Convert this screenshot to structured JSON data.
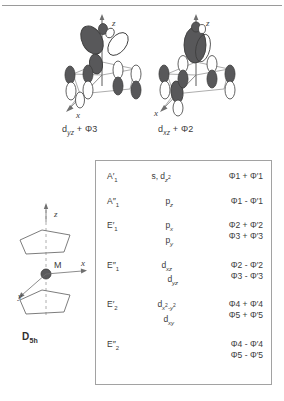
{
  "figure": {
    "title_line": "divider-rule",
    "orbital_diagrams": [
      {
        "id": "dyz-phi3",
        "caption_main": "d",
        "caption_sub": "yz",
        "caption_rest": " + Φ3",
        "axis_z": "z",
        "axis_x": "x"
      },
      {
        "id": "dxz-phi2",
        "caption_main": "d",
        "caption_sub": "xz",
        "caption_rest": " + Φ2",
        "axis_z": "z",
        "axis_x": "x"
      }
    ],
    "sandwich": {
      "metal_label": "M",
      "axis_z": "z",
      "axis_x": "x",
      "axis_y": "y",
      "point_group": "D",
      "point_group_sub": "5h"
    }
  },
  "table": {
    "rows": [
      {
        "symmetry": "A",
        "prime": "′",
        "sym_sub": "1",
        "orbitals": [
          {
            "text": "s, d",
            "sub": "z",
            "sup": "2"
          }
        ],
        "phi": [
          "Φ1 + Φ′1"
        ]
      },
      {
        "symmetry": "A",
        "prime": "″",
        "sym_sub": "1",
        "orbitals": [
          {
            "text": "p",
            "sub": "z",
            "sup": ""
          }
        ],
        "phi": [
          "Φ1 - Φ′1"
        ]
      },
      {
        "symmetry": "E",
        "prime": "′",
        "sym_sub": "1",
        "orbitals": [
          {
            "text": "p",
            "sub": "x",
            "sup": ""
          },
          {
            "text": "p",
            "sub": "y",
            "sup": ""
          }
        ],
        "phi": [
          "Φ2 + Φ′2",
          "Φ3 + Φ′3"
        ]
      },
      {
        "symmetry": "E",
        "prime": "″",
        "sym_sub": "1",
        "orbitals": [
          {
            "text": "d",
            "sub": "xz",
            "sup": ""
          },
          {
            "text": "d",
            "sub": "yz",
            "sup": ""
          }
        ],
        "phi": [
          "Φ2 - Φ′2",
          "Φ3 - Φ′3"
        ]
      },
      {
        "symmetry": "E",
        "prime": "′",
        "sym_sub": "2",
        "orbitals": [
          {
            "text": "d",
            "sub": "x",
            "sup": "2",
            "sub2": "-y",
            "sup2": "2"
          },
          {
            "text": "d",
            "sub": "xy",
            "sup": ""
          }
        ],
        "phi": [
          "Φ4 + Φ′4",
          "Φ5 + Φ′5"
        ]
      },
      {
        "symmetry": "E",
        "prime": "″",
        "sym_sub": "2",
        "orbitals": [],
        "phi": [
          "Φ4 - Φ′4",
          "Φ5 - Φ′5"
        ]
      }
    ]
  },
  "colors": {
    "lobe_fill": "#58585a",
    "lobe_stroke": "#3c3c3c",
    "empty_lobe": "#ffffff",
    "axis": "#7d7d7d",
    "border": "#a2a2a2",
    "text": "#3b3b3b"
  }
}
